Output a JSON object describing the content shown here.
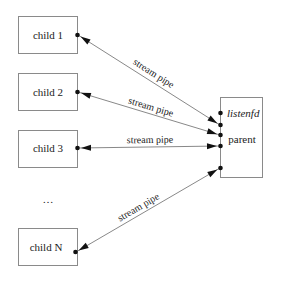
{
  "diagram": {
    "children": [
      {
        "label": "child 1"
      },
      {
        "label": "child 2"
      },
      {
        "label": "child 3"
      },
      {
        "label": "child N"
      }
    ],
    "ellipsis": "…",
    "parent": {
      "label": "parent",
      "fd_label": "listenfd"
    },
    "pipe_label": "stream pipe",
    "pipes": [
      {
        "from": "child 1",
        "to": "parent",
        "label": "stream pipe"
      },
      {
        "from": "child 2",
        "to": "parent",
        "label": "stream pipe"
      },
      {
        "from": "child 3",
        "to": "parent",
        "label": "stream pipe"
      },
      {
        "from": "child N",
        "to": "parent",
        "label": "stream pipe"
      }
    ]
  }
}
